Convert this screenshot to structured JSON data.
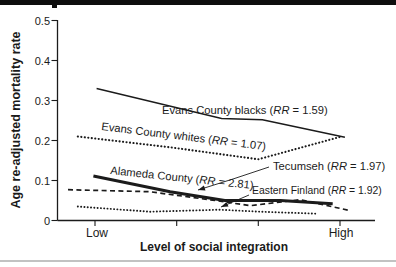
{
  "figure": {
    "ink_color": "#1b1b1b",
    "top_bar_color": "#0e0e0e",
    "bottom_rule_color": "#c2c2c2"
  },
  "chart_data": {
    "type": "line",
    "title": "",
    "xlabel": "Level of social integration",
    "ylabel": "Age re-adjusted mortality rate",
    "ylim": [
      0,
      0.5
    ],
    "grid": false,
    "legend_position": "inline labels next to each line, with relative risk (RR) values",
    "y_ticks": [
      "0",
      "0.1",
      "0.2",
      "0.3",
      "0.4",
      "0.5"
    ],
    "x_ticks": [
      {
        "pos": 0,
        "label": "Low"
      },
      {
        "pos": 1,
        "label": ""
      },
      {
        "pos": 2,
        "label": ""
      },
      {
        "pos": 3,
        "label": "High"
      }
    ],
    "x_units_note": "social integration scale: 0 = Low tick, 3 = High tick",
    "series": [
      {
        "id": "evans-county-blacks",
        "name": "Evans County blacks",
        "rr": "1.59",
        "style": "solid-thin",
        "points": [
          [
            0.02,
            0.33
          ],
          [
            1.55,
            0.255
          ],
          [
            2.05,
            0.252
          ],
          [
            3.06,
            0.208
          ]
        ],
        "label": {
          "parts": [
            {
              "t": "Evans County blacks ("
            },
            {
              "t": "RR",
              "i": true
            },
            {
              "t": " = 1.59)"
            }
          ],
          "x": 162,
          "y": 114,
          "rotate": 0
        }
      },
      {
        "id": "evans-county-whites",
        "name": "Evans County whites",
        "rr": "1.07",
        "style": "dotted",
        "points": [
          [
            -0.21,
            0.21
          ],
          [
            0.92,
            0.183
          ],
          [
            2.0,
            0.153
          ],
          [
            3.02,
            0.21
          ]
        ],
        "label": {
          "parts": [
            {
              "t": "Evans County whites ("
            },
            {
              "t": "RR",
              "i": true
            },
            {
              "t": " = 1.07)"
            }
          ],
          "x": 101,
          "y": 130,
          "rotate": 7
        }
      },
      {
        "id": "tecumseh",
        "name": "Tecumseh",
        "rr": "1.97",
        "style": "dashed",
        "points": [
          [
            -0.33,
            0.077
          ],
          [
            0.67,
            0.072
          ],
          [
            1.47,
            0.05
          ],
          [
            1.9,
            0.037
          ],
          [
            2.51,
            0.052
          ],
          [
            3.12,
            0.025
          ]
        ],
        "label": {
          "parts": [
            {
              "t": "Tecumseh ("
            },
            {
              "t": "RR",
              "i": true
            },
            {
              "t": " = 1.97)"
            }
          ],
          "x": 273,
          "y": 170,
          "rotate": 0
        },
        "leader": [
          [
            269,
            167
          ],
          [
            233,
            179
          ],
          [
            198,
            190
          ]
        ]
      },
      {
        "id": "eastern-finland",
        "name": "Eastern Finland",
        "rr": "1.92",
        "style": "dotted-fine",
        "points": [
          [
            -0.21,
            0.035
          ],
          [
            0.67,
            0.022
          ],
          [
            1.53,
            0.027
          ],
          [
            2.02,
            0.022
          ],
          [
            2.73,
            0.017
          ]
        ],
        "label": {
          "parts": [
            {
              "t": "Eastern Finland ("
            },
            {
              "t": "RR",
              "i": true
            },
            {
              "t": " = 1.92)"
            }
          ],
          "x": 252,
          "y": 194,
          "rotate": 0,
          "fs": 10.4
        },
        "leader": [
          [
            249,
            195
          ],
          [
            221,
            207
          ]
        ]
      },
      {
        "id": "alameda-county",
        "name": "Alameda County",
        "rr": "2.81",
        "style": "solid-thick",
        "points": [
          [
            -0.02,
            0.111
          ],
          [
            0.92,
            0.072
          ],
          [
            1.59,
            0.05
          ],
          [
            2.27,
            0.05
          ],
          [
            2.91,
            0.042
          ]
        ],
        "label": {
          "parts": [
            {
              "t": "Alameda County ("
            },
            {
              "t": "RR",
              "i": true
            },
            {
              "t": " = 2.81)"
            }
          ],
          "x": 110,
          "y": 174,
          "rotate": 6
        }
      }
    ]
  }
}
